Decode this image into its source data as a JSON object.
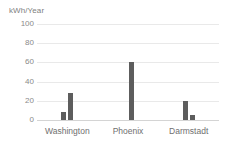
{
  "chart_data": {
    "type": "bar",
    "title": "",
    "xlabel": "",
    "ylabel": "kWh/Year",
    "ylim": [
      0,
      100
    ],
    "yticks": [
      0,
      20,
      40,
      60,
      80,
      100
    ],
    "grid": true,
    "legend_position": "none",
    "categories": [
      "Washington",
      "Phoenix",
      "Darmstadt"
    ],
    "series": [
      {
        "name": "series-1",
        "values": [
          8,
          0,
          20
        ]
      },
      {
        "name": "series-2",
        "values": [
          28,
          60,
          5
        ]
      }
    ],
    "colors": {
      "bar": "#5d5d5d",
      "gridline": "#e9e9e9",
      "baseline": "#d4d4d4",
      "text": "#808080"
    }
  },
  "axis": {
    "y_title": "kWh/Year",
    "y_tick_labels": [
      "100",
      "80",
      "60",
      "40",
      "20",
      "0"
    ],
    "x_tick_labels": [
      "Washington",
      "Phoenix",
      "Darmstadt"
    ]
  }
}
